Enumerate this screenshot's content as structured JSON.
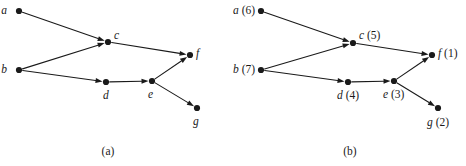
{
  "figure": {
    "background_color": "#ffffff",
    "ink_color": "#1a1a1a",
    "width": 466,
    "height": 166
  },
  "chart_data": {
    "type": "diagram",
    "diagram_kind": "directed-acyclic-graph",
    "title": "",
    "panels": [
      {
        "id": "a",
        "caption": "(a)",
        "caption_x": 108,
        "caption_y": 146,
        "description": "Directed acyclic graph with vertices labeled by letters only",
        "nodes": [
          {
            "id": "a",
            "label": "a",
            "number": "",
            "text": "a",
            "x": 19,
            "y": 11,
            "label_x": 7,
            "label_y": 5,
            "label_align": "right"
          },
          {
            "id": "b",
            "label": "b",
            "number": "",
            "text": "b",
            "x": 19,
            "y": 70,
            "label_x": 7,
            "label_y": 64,
            "label_align": "right"
          },
          {
            "id": "c",
            "label": "c",
            "number": "",
            "text": "c",
            "x": 108,
            "y": 42,
            "label_x": 114,
            "label_y": 30,
            "label_align": "left"
          },
          {
            "id": "d",
            "label": "d",
            "number": "",
            "text": "d",
            "x": 106,
            "y": 82,
            "label_x": 103,
            "label_y": 90,
            "label_align": "left"
          },
          {
            "id": "e",
            "label": "e",
            "number": "",
            "text": "e",
            "x": 152,
            "y": 81,
            "label_x": 148,
            "label_y": 89,
            "label_align": "left"
          },
          {
            "id": "f",
            "label": "f",
            "number": "",
            "text": "f",
            "x": 190,
            "y": 55,
            "label_x": 196,
            "label_y": 48,
            "label_align": "left"
          },
          {
            "id": "g",
            "label": "g",
            "number": "",
            "text": "g",
            "x": 197,
            "y": 108,
            "label_x": 193,
            "label_y": 116,
            "label_align": "left"
          }
        ],
        "edges": [
          {
            "from": "a",
            "to": "c",
            "directed": true
          },
          {
            "from": "b",
            "to": "c",
            "directed": true
          },
          {
            "from": "b",
            "to": "d",
            "directed": true
          },
          {
            "from": "c",
            "to": "f",
            "directed": true
          },
          {
            "from": "d",
            "to": "e",
            "directed": true
          },
          {
            "from": "e",
            "to": "f",
            "directed": true
          },
          {
            "from": "e",
            "to": "g",
            "directed": true
          }
        ]
      },
      {
        "id": "b",
        "caption": "(b)",
        "caption_x": 117,
        "caption_y": 146,
        "description": "Same directed acyclic graph with topological numbering in parentheses",
        "nodes": [
          {
            "id": "a",
            "label": "a",
            "number": "(6)",
            "text": "a (6)",
            "x": 28,
            "y": 11,
            "label_x": 16,
            "label_y": 5,
            "label_align": "right"
          },
          {
            "id": "b",
            "label": "b",
            "number": "(7)",
            "text": "b (7)",
            "x": 28,
            "y": 70,
            "label_x": 16,
            "label_y": 64,
            "label_align": "right"
          },
          {
            "id": "c",
            "label": "c",
            "number": "(5)",
            "text": "c (5)",
            "x": 120,
            "y": 43,
            "label_x": 126,
            "label_y": 30,
            "label_align": "left"
          },
          {
            "id": "d",
            "label": "d",
            "number": "(4)",
            "text": "d (4)",
            "x": 115,
            "y": 82,
            "label_x": 104,
            "label_y": 90,
            "label_align": "left"
          },
          {
            "id": "e",
            "label": "e",
            "number": "(3)",
            "text": "e (3)",
            "x": 161,
            "y": 81,
            "label_x": 150,
            "label_y": 89,
            "label_align": "left"
          },
          {
            "id": "f",
            "label": "f",
            "number": "(1)",
            "text": "f (1)",
            "x": 199,
            "y": 55,
            "label_x": 205,
            "label_y": 48,
            "label_align": "left"
          },
          {
            "id": "g",
            "label": "g",
            "number": "(2)",
            "text": "g (2)",
            "x": 205,
            "y": 108,
            "label_x": 194,
            "label_y": 117,
            "label_align": "left"
          }
        ],
        "edges": [
          {
            "from": "a",
            "to": "c",
            "directed": true
          },
          {
            "from": "b",
            "to": "c",
            "directed": true
          },
          {
            "from": "b",
            "to": "d",
            "directed": true
          },
          {
            "from": "c",
            "to": "f",
            "directed": true
          },
          {
            "from": "d",
            "to": "e",
            "directed": true
          },
          {
            "from": "e",
            "to": "f",
            "directed": true
          },
          {
            "from": "e",
            "to": "g",
            "directed": true
          }
        ]
      }
    ],
    "node_radius": 3.1,
    "edge_stroke_width": 1.1,
    "arrowhead_length": 7,
    "arrowhead_width": 5
  }
}
